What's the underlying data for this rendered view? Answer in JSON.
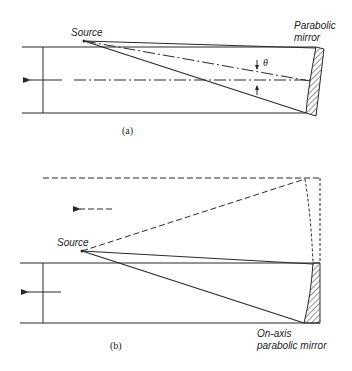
{
  "figure": {
    "panel_a": {
      "caption": "(a)",
      "source_label": "Source",
      "mirror_label_line1": "Parabolic",
      "mirror_label_line2": "mirror",
      "angle_label": "θ"
    },
    "panel_b": {
      "caption": "(b)",
      "source_label": "Source",
      "mirror_label_line1": "On-axis",
      "mirror_label_line2": "parabolic mirror"
    },
    "colors": {
      "line": "#2a2a2a",
      "background": "#ffffff"
    }
  }
}
